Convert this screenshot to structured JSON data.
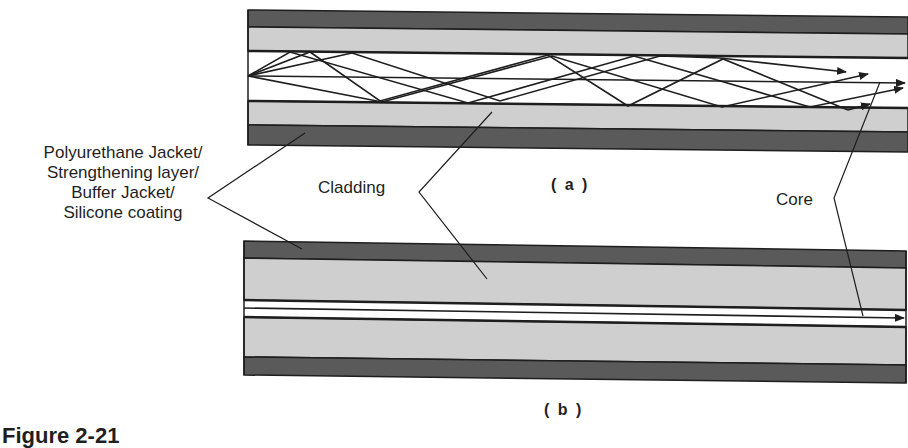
{
  "figure": {
    "caption_partial": "Figure 2-21",
    "panel_a_label": "( a )",
    "panel_b_label": "( b )"
  },
  "labels": {
    "jacket_lines": [
      "Polyurethane Jacket/",
      "Strengthening layer/",
      "Buffer Jacket/",
      "Silicone coating"
    ],
    "cladding": "Cladding",
    "core": "Core"
  },
  "colors": {
    "jacket": "#5a5a5a",
    "cladding": "#cfcfcf",
    "core": "#ffffff",
    "line": "#1e1e1e"
  },
  "panels": [
    {
      "id": "a",
      "type": "multimode step-index fiber",
      "layers": [
        "jacket",
        "cladding",
        "core",
        "cladding",
        "jacket"
      ],
      "rays": "multiple zig-zag rays reflecting at core-cladding boundary, plus axial ray; arrows at right end"
    },
    {
      "id": "b",
      "type": "single-mode fiber",
      "layers": [
        "jacket",
        "cladding",
        "core",
        "cladding",
        "jacket"
      ],
      "rays": "single axial ray with arrow at right end"
    }
  ]
}
